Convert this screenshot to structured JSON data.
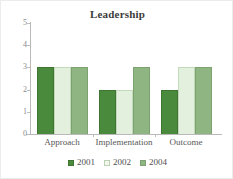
{
  "chart_data": {
    "type": "bar",
    "title": "Leadership",
    "xlabel": "",
    "ylabel": "",
    "ylim": [
      0,
      5
    ],
    "yticks": [
      0,
      1,
      2,
      3,
      4,
      5
    ],
    "grid": false,
    "legend_position": "bottom-center",
    "categories": [
      "Approach",
      "Implementation",
      "Outcome"
    ],
    "series": [
      {
        "name": "2001",
        "color": "#4a8a3c",
        "values": [
          3,
          2,
          2
        ]
      },
      {
        "name": "2002",
        "color": "#e4f0de",
        "values": [
          3,
          2,
          3
        ]
      },
      {
        "name": "2004",
        "color": "#8fb583",
        "values": [
          3,
          3,
          3
        ]
      }
    ]
  },
  "legend": {
    "items": [
      {
        "label": "2001"
      },
      {
        "label": "2002"
      },
      {
        "label": "2004"
      }
    ]
  }
}
